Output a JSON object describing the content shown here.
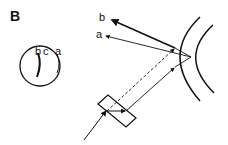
{
  "figure": {
    "panel_label": "B",
    "inset": {
      "labels": [
        "b",
        "c",
        "a"
      ]
    },
    "rays": {
      "b_label": "b",
      "a_label": "a"
    },
    "colors": {
      "stroke": "#111111",
      "background": "#ffffff"
    }
  }
}
